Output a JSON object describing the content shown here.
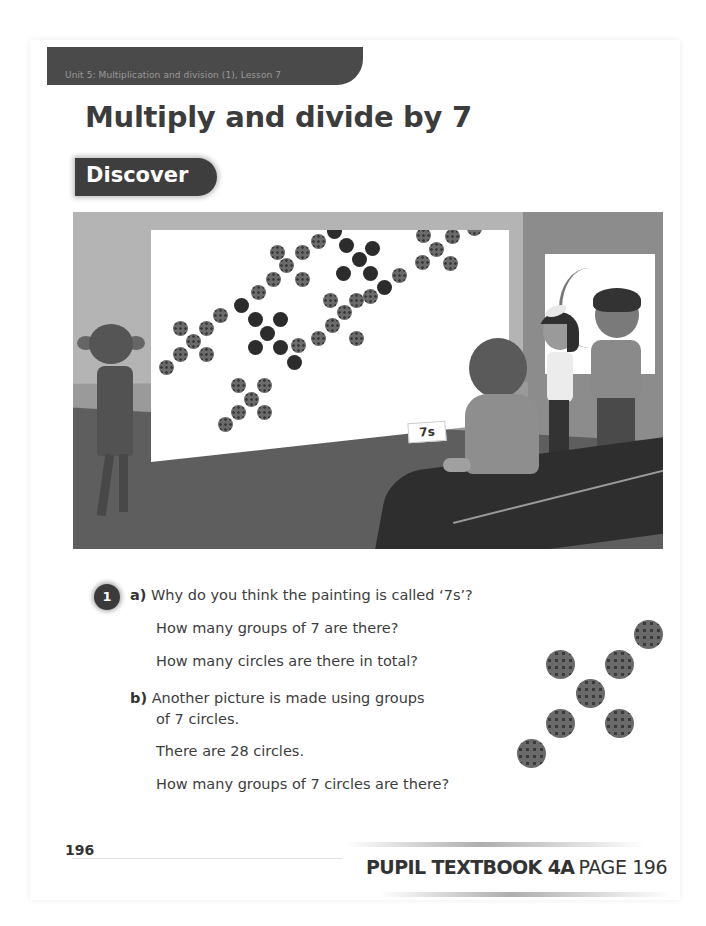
{
  "header": {
    "unit_banner": "Unit 5: Multiplication and division (1), Lesson 7",
    "title": "Multiply and divide by 7",
    "section_tag": "Discover"
  },
  "illustration": {
    "description": "Children looking at a painting of dot groups in a gallery",
    "painting_label": "7s",
    "painting_groups_of_7": 8,
    "painting_total_circles": 56
  },
  "question": {
    "number": "1",
    "part_a": {
      "letter": "a)",
      "lines": [
        "Why do you think the painting is called ‘7s’?",
        "How many groups of 7 are there?",
        "How many circles are there in total?"
      ]
    },
    "part_b": {
      "letter": "b)",
      "lines": [
        "Another picture is made using groups",
        "of 7 circles.",
        "There are 28 circles.",
        "How many groups of 7 circles are there?"
      ]
    },
    "example_group_circles": 7
  },
  "footer": {
    "page_number": "196",
    "book_label": "PUPIL TEXTBOOK 4A",
    "page_label": "PAGE 196"
  }
}
